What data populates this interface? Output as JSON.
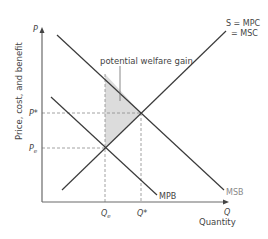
{
  "diagram": {
    "type": "economics-externality-diagram",
    "title": "",
    "y_axis": {
      "symbol": "P",
      "label": "Price, cost, and benefit"
    },
    "x_axis": {
      "symbol": "Q",
      "label": "Quantity"
    },
    "curves": {
      "supply": {
        "label_line1": "S = MPC",
        "label_line2": "= MSC"
      },
      "msb": {
        "label": "MSB"
      },
      "mpb": {
        "label": "MPB"
      }
    },
    "price_levels": {
      "p_star": "P*",
      "p_e": "P",
      "p_e_sub": "e"
    },
    "quantity_levels": {
      "q_star": "Q*",
      "q_e": "Q",
      "q_e_sub": "e"
    },
    "annotation": {
      "welfare_gain": "potential welfare gain"
    },
    "colors": {
      "line": "#3a3a3a",
      "axis": "#6a6a6a",
      "shade": "#dcdcdc",
      "dashed": "#8a8a8a",
      "msb_label": "#8a8a8a"
    }
  }
}
